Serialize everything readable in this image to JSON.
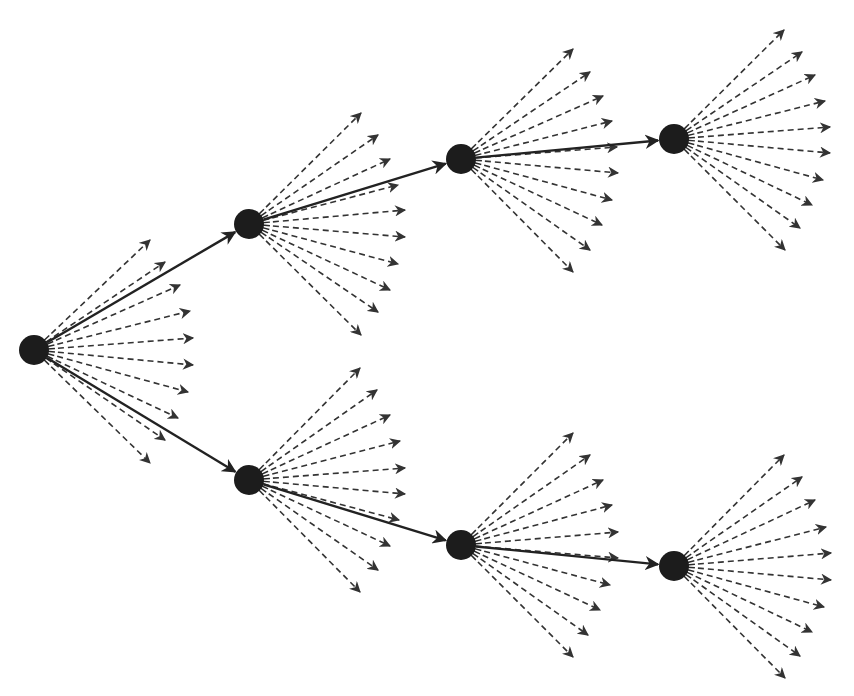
{
  "diagram": {
    "title": "",
    "type": "branching-tree",
    "colors": {
      "background": "#ffffff",
      "node": "#1c1c1c",
      "main_edge": "#222222",
      "fan_arrow": "#333333"
    },
    "node_radius": 15,
    "nodes": [
      {
        "id": "root",
        "x": 34,
        "y": 350
      },
      {
        "id": "top-1",
        "x": 249,
        "y": 224
      },
      {
        "id": "top-2",
        "x": 461,
        "y": 159
      },
      {
        "id": "top-3",
        "x": 674,
        "y": 139
      },
      {
        "id": "bottom-1",
        "x": 249,
        "y": 480
      },
      {
        "id": "bottom-2",
        "x": 461,
        "y": 545
      },
      {
        "id": "bottom-3",
        "x": 674,
        "y": 566
      }
    ],
    "edges": [
      {
        "from": "root",
        "to": "top-1",
        "style": "solid"
      },
      {
        "from": "top-1",
        "to": "top-2",
        "style": "solid"
      },
      {
        "from": "top-2",
        "to": "top-3",
        "style": "solid"
      },
      {
        "from": "root",
        "to": "bottom-1",
        "style": "solid"
      },
      {
        "from": "bottom-1",
        "to": "bottom-2",
        "style": "solid"
      },
      {
        "from": "bottom-2",
        "to": "bottom-3",
        "style": "solid"
      }
    ],
    "fans": [
      {
        "node": "root",
        "style": "dashed",
        "targets": [
          [
            150,
            240
          ],
          [
            165,
            262
          ],
          [
            180,
            285
          ],
          [
            190,
            311
          ],
          [
            193,
            338
          ],
          [
            193,
            365
          ],
          [
            188,
            392
          ],
          [
            178,
            418
          ],
          [
            165,
            440
          ],
          [
            150,
            463
          ]
        ]
      },
      {
        "node": "top-1",
        "style": "dashed",
        "targets": [
          [
            361,
            113
          ],
          [
            378,
            135
          ],
          [
            390,
            159
          ],
          [
            398,
            185
          ],
          [
            405,
            210
          ],
          [
            405,
            237
          ],
          [
            398,
            264
          ],
          [
            390,
            290
          ],
          [
            378,
            312
          ],
          [
            361,
            335
          ]
        ]
      },
      {
        "node": "top-2",
        "style": "dashed",
        "targets": [
          [
            573,
            49
          ],
          [
            590,
            72
          ],
          [
            603,
            96
          ],
          [
            612,
            121
          ],
          [
            617,
            147
          ],
          [
            618,
            173
          ],
          [
            612,
            200
          ],
          [
            602,
            225
          ],
          [
            590,
            250
          ],
          [
            573,
            272
          ]
        ]
      },
      {
        "node": "top-3",
        "style": "dashed",
        "targets": [
          [
            784,
            30
          ],
          [
            802,
            52
          ],
          [
            815,
            75
          ],
          [
            825,
            101
          ],
          [
            830,
            127
          ],
          [
            830,
            153
          ],
          [
            823,
            180
          ],
          [
            812,
            205
          ],
          [
            800,
            228
          ],
          [
            785,
            250
          ]
        ]
      },
      {
        "node": "bottom-1",
        "style": "dashed",
        "targets": [
          [
            360,
            368
          ],
          [
            377,
            390
          ],
          [
            390,
            415
          ],
          [
            400,
            441
          ],
          [
            405,
            468
          ],
          [
            405,
            494
          ],
          [
            399,
            520
          ],
          [
            390,
            546
          ],
          [
            378,
            570
          ],
          [
            360,
            592
          ]
        ]
      },
      {
        "node": "bottom-2",
        "style": "dashed",
        "targets": [
          [
            573,
            433
          ],
          [
            590,
            455
          ],
          [
            603,
            480
          ],
          [
            612,
            505
          ],
          [
            618,
            532
          ],
          [
            618,
            558
          ],
          [
            610,
            585
          ],
          [
            600,
            610
          ],
          [
            588,
            635
          ],
          [
            573,
            657
          ]
        ]
      },
      {
        "node": "bottom-3",
        "style": "dashed",
        "targets": [
          [
            784,
            455
          ],
          [
            802,
            477
          ],
          [
            815,
            500
          ],
          [
            826,
            527
          ],
          [
            831,
            553
          ],
          [
            831,
            580
          ],
          [
            824,
            607
          ],
          [
            812,
            632
          ],
          [
            800,
            656
          ],
          [
            785,
            678
          ]
        ]
      }
    ]
  }
}
